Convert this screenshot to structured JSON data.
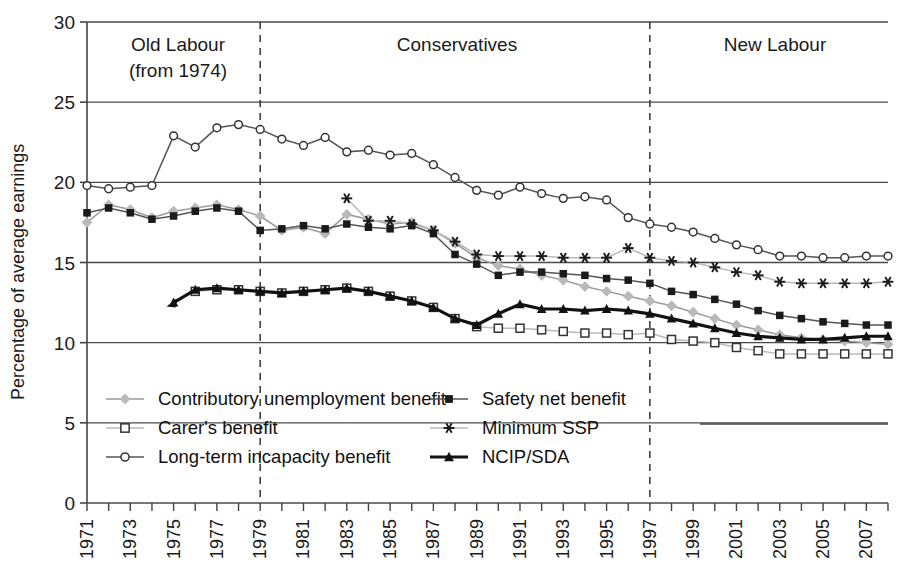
{
  "chart_data": {
    "type": "line",
    "title": "",
    "xlabel": "",
    "ylabel": "Percentage of average earnings",
    "ylim": [
      0,
      30
    ],
    "ytickstep": 5,
    "yticks": [
      "0",
      "5",
      "10",
      "15",
      "20",
      "25",
      "30"
    ],
    "xlim": [
      1971,
      2008
    ],
    "xticks": [
      "1971",
      "1973",
      "1975",
      "1977",
      "1979",
      "1981",
      "1983",
      "1985",
      "1987",
      "1989",
      "1991",
      "1993",
      "1995",
      "1997",
      "1999",
      "2001",
      "2003",
      "2005",
      "2007"
    ],
    "grid": "horizontal",
    "legend_position": "inside-bottom-left",
    "annotations": [
      {
        "label": "Old Labour\n(from 1974)",
        "line1": "Old Labour",
        "line2": "(from 1974)",
        "x": 1975
      },
      {
        "label": "Conservatives",
        "line1": "Conservatives",
        "line2": "",
        "x": 1988
      },
      {
        "label": "New Labour",
        "line1": "New Labour",
        "line2": "",
        "x": 2002
      }
    ],
    "vlines": [
      1979,
      1997
    ],
    "series": [
      {
        "name": "Contributory unemployment benefit",
        "marker": "diamond",
        "color": "#b9b9b9",
        "line_color": "#9a9a9a",
        "x": [
          1971,
          1972,
          1973,
          1974,
          1975,
          1976,
          1977,
          1978,
          1979,
          1980,
          1981,
          1982,
          1983,
          1984,
          1985,
          1986,
          1987,
          1988,
          1989,
          1990,
          1991,
          1992,
          1993,
          1994,
          1995,
          1996,
          1997,
          1998,
          1999,
          2000,
          2001,
          2002,
          2003,
          2004,
          2005,
          2006,
          2007,
          2008
        ],
        "values": [
          17.5,
          18.6,
          18.3,
          17.8,
          18.2,
          18.4,
          18.6,
          18.3,
          17.9,
          17.0,
          17.2,
          16.8,
          18.0,
          17.7,
          17.4,
          17.5,
          17.0,
          16.2,
          15.3,
          14.8,
          14.6,
          14.2,
          13.9,
          13.5,
          13.2,
          12.9,
          12.6,
          12.3,
          11.9,
          11.5,
          11.1,
          10.8,
          10.5,
          10.3,
          10.2,
          10.1,
          10.0,
          9.9
        ]
      },
      {
        "name": "Safety net benefit",
        "marker": "square-filled",
        "color": "#1a1a1a",
        "line_color": "#555555",
        "x": [
          1971,
          1972,
          1973,
          1974,
          1975,
          1976,
          1977,
          1978,
          1979,
          1980,
          1981,
          1982,
          1983,
          1984,
          1985,
          1986,
          1987,
          1988,
          1989,
          1990,
          1991,
          1992,
          1993,
          1994,
          1995,
          1996,
          1997,
          1998,
          1999,
          2000,
          2001,
          2002,
          2003,
          2004,
          2005,
          2006,
          2007,
          2008
        ],
        "values": [
          18.1,
          18.4,
          18.1,
          17.7,
          17.9,
          18.2,
          18.4,
          18.2,
          17.0,
          17.1,
          17.3,
          17.1,
          17.4,
          17.2,
          17.1,
          17.3,
          16.8,
          15.5,
          14.9,
          14.2,
          14.4,
          14.4,
          14.3,
          14.2,
          14.0,
          13.9,
          13.7,
          13.2,
          13.0,
          12.7,
          12.4,
          12.0,
          11.7,
          11.5,
          11.3,
          11.2,
          11.1,
          11.1
        ]
      },
      {
        "name": "Carer's benefit",
        "marker": "square-open",
        "color": "#ffffff",
        "line_color": "#b9b9b9",
        "x": [
          1976,
          1977,
          1978,
          1979,
          1980,
          1981,
          1982,
          1983,
          1984,
          1985,
          1986,
          1987,
          1988,
          1989,
          1990,
          1991,
          1992,
          1993,
          1994,
          1995,
          1996,
          1997,
          1998,
          1999,
          2000,
          2001,
          2002,
          2003,
          2004,
          2005,
          2006,
          2007,
          2008
        ],
        "values": [
          13.2,
          13.3,
          13.3,
          13.2,
          13.1,
          13.2,
          13.3,
          13.4,
          13.2,
          12.9,
          12.6,
          12.2,
          11.5,
          11.0,
          10.9,
          10.9,
          10.8,
          10.7,
          10.6,
          10.6,
          10.5,
          10.6,
          10.2,
          10.1,
          10.0,
          9.7,
          9.5,
          9.3,
          9.3,
          9.3,
          9.3,
          9.3,
          9.3
        ]
      },
      {
        "name": "Minimum SSP",
        "marker": "asterisk",
        "color": "#1a1a1a",
        "line_color": "#b9b9b9",
        "x": [
          1983,
          1984,
          1985,
          1986,
          1987,
          1988,
          1989,
          1990,
          1991,
          1992,
          1993,
          1994,
          1995,
          1996,
          1997,
          1998,
          1999,
          2000,
          2001,
          2002,
          2003,
          2004,
          2005,
          2006,
          2007,
          2008
        ],
        "values": [
          19.0,
          17.6,
          17.6,
          17.4,
          17.0,
          16.3,
          15.5,
          15.4,
          15.4,
          15.4,
          15.3,
          15.3,
          15.3,
          15.9,
          15.3,
          15.1,
          15.0,
          14.7,
          14.4,
          14.2,
          13.8,
          13.7,
          13.7,
          13.7,
          13.7,
          13.8
        ]
      },
      {
        "name": "Long-term incapacity benefit",
        "marker": "circle-open",
        "color": "#ffffff",
        "line_color": "#555555",
        "x": [
          1971,
          1972,
          1973,
          1974,
          1975,
          1976,
          1977,
          1978,
          1979,
          1980,
          1981,
          1982,
          1983,
          1984,
          1985,
          1986,
          1987,
          1988,
          1989,
          1990,
          1991,
          1992,
          1993,
          1994,
          1995,
          1996,
          1997,
          1998,
          1999,
          2000,
          2001,
          2002,
          2003,
          2004,
          2005,
          2006,
          2007,
          2008
        ],
        "values": [
          19.8,
          19.6,
          19.7,
          19.8,
          22.9,
          22.2,
          23.4,
          23.6,
          23.3,
          22.7,
          22.3,
          22.8,
          21.9,
          22.0,
          21.7,
          21.8,
          21.1,
          20.3,
          19.5,
          19.2,
          19.7,
          19.3,
          19.0,
          19.1,
          18.9,
          17.8,
          17.4,
          17.2,
          16.9,
          16.5,
          16.1,
          15.8,
          15.4,
          15.4,
          15.3,
          15.3,
          15.4,
          15.4
        ]
      },
      {
        "name": "NCIP/SDA",
        "marker": "triangle-filled",
        "color": "#111111",
        "line_color": "#111111",
        "x": [
          1975,
          1976,
          1977,
          1978,
          1979,
          1980,
          1981,
          1982,
          1983,
          1984,
          1985,
          1986,
          1987,
          1988,
          1989,
          1990,
          1991,
          1992,
          1993,
          1994,
          1995,
          1996,
          1997,
          1998,
          1999,
          2000,
          2001,
          2002,
          2003,
          2004,
          2005,
          2006,
          2007,
          2008
        ],
        "values": [
          12.5,
          13.3,
          13.4,
          13.3,
          13.2,
          13.1,
          13.2,
          13.3,
          13.4,
          13.2,
          12.9,
          12.6,
          12.2,
          11.5,
          11.1,
          11.8,
          12.4,
          12.1,
          12.1,
          12.0,
          12.1,
          12.0,
          11.8,
          11.5,
          11.2,
          10.9,
          10.6,
          10.4,
          10.3,
          10.2,
          10.2,
          10.3,
          10.4,
          10.4
        ]
      }
    ]
  },
  "legend": {
    "items": [
      {
        "label": "Contributory unemployment benefit",
        "marker": "diamond"
      },
      {
        "label": "Safety net benefit",
        "marker": "square-filled"
      },
      {
        "label": "Carer's benefit",
        "marker": "square-open"
      },
      {
        "label": "Minimum SSP",
        "marker": "asterisk"
      },
      {
        "label": "Long-term incapacity benefit",
        "marker": "circle-open"
      },
      {
        "label": "NCIP/SDA",
        "marker": "triangle-filled"
      }
    ]
  },
  "axis": {
    "y_title": "Percentage of average earnings"
  },
  "eras": {
    "old_labour_l1": "Old Labour",
    "old_labour_l2": "(from 1974)",
    "conservatives": "Conservatives",
    "new_labour": "New Labour"
  }
}
